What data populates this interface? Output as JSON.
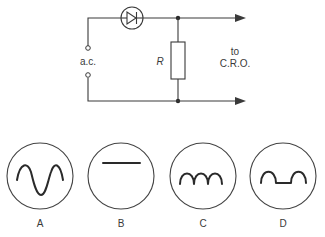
{
  "circuit": {
    "source_label": "a.c.",
    "resistor_label": "R",
    "output_label_line1": "to",
    "output_label_line2": "C.R.O.",
    "components": [
      "diode",
      "resistor",
      "a.c. terminals",
      "output arrows to C.R.O."
    ]
  },
  "traces": [
    {
      "label": "A",
      "waveform": "full sine wave"
    },
    {
      "label": "B",
      "waveform": "flat line (d.c.)"
    },
    {
      "label": "C",
      "waveform": "full-wave rectified"
    },
    {
      "label": "D",
      "waveform": "half-wave rectified"
    }
  ]
}
